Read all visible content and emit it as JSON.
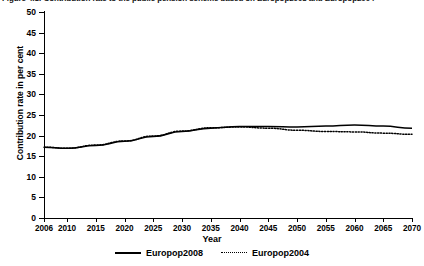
{
  "figure": {
    "caption_clipped": "Figure 4.1: Contribution rate to the public pension scheme based on Europop2008 and Europop2004"
  },
  "axes": {
    "x_title": "Year",
    "y_title": "Contribution rate in per cent",
    "y_ticks": [
      "0",
      "5",
      "10",
      "15",
      "20",
      "25",
      "30",
      "35",
      "40",
      "45",
      "50"
    ],
    "x_ticks": [
      "2006",
      "2010",
      "2015",
      "2020",
      "2025",
      "2030",
      "2035",
      "2040",
      "2045",
      "2050",
      "2055",
      "2060",
      "2065",
      "2070"
    ]
  },
  "legend": {
    "items": [
      {
        "label": "Europop2008",
        "style": "solid"
      },
      {
        "label": "Europop2004",
        "style": "dotted"
      }
    ]
  },
  "chart_data": {
    "type": "line",
    "title": "Contribution rate to the public pension scheme based on Europop2008 and Europop2004",
    "xlabel": "Year",
    "ylabel": "Contribution rate in per cent",
    "xlim": [
      2006,
      2070
    ],
    "ylim": [
      0,
      50
    ],
    "y_tick_step": 5,
    "grid": false,
    "legend_position": "bottom-center",
    "x": [
      2006,
      2010,
      2015,
      2020,
      2025,
      2030,
      2035,
      2040,
      2045,
      2050,
      2055,
      2060,
      2065,
      2070
    ],
    "series": [
      {
        "name": "Europop2008",
        "style": "solid",
        "color": "#000000",
        "values": [
          17.2,
          16.9,
          17.6,
          18.6,
          19.8,
          21.0,
          21.8,
          22.2,
          22.2,
          22.1,
          22.3,
          22.6,
          22.3,
          21.8
        ]
      },
      {
        "name": "Europop2004",
        "style": "dotted",
        "color": "#000000",
        "values": [
          17.2,
          16.9,
          17.7,
          18.7,
          19.9,
          21.1,
          21.9,
          22.1,
          21.8,
          21.3,
          21.0,
          20.9,
          20.6,
          20.3
        ]
      }
    ]
  }
}
